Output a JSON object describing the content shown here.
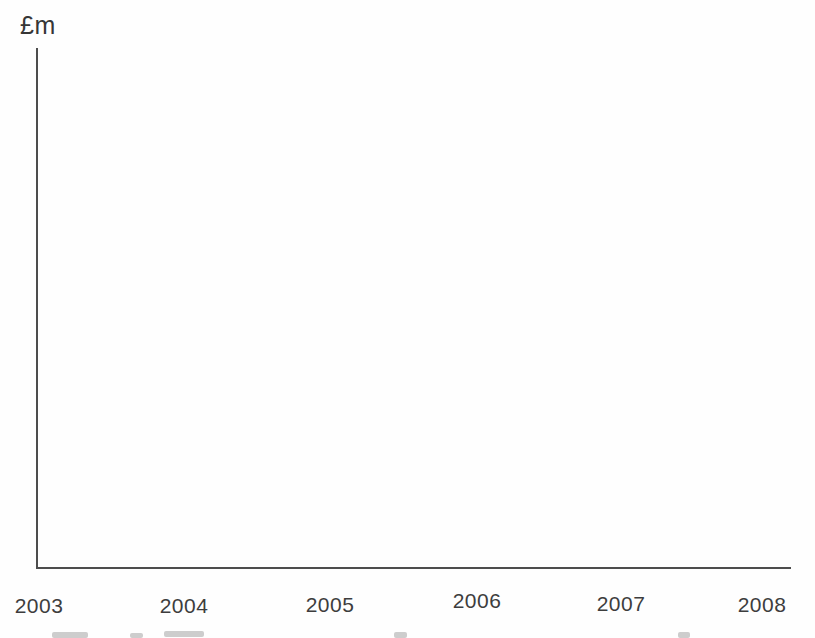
{
  "chart_data": {
    "type": "line",
    "title": "",
    "xlabel": "",
    "ylabel": "£m",
    "x_categories": [
      "2003",
      "2004",
      "2005",
      "2006",
      "2007",
      "2008"
    ],
    "series": [],
    "grid": false,
    "legend": "none",
    "axis_color": "#4d4d4d",
    "label_color": "#3d3d3d",
    "note": "empty axes template from a scanned page; no data series are plotted in the chart area"
  }
}
